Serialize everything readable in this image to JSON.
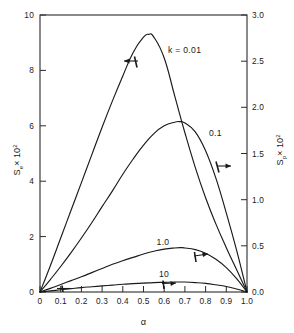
{
  "chart_data": {
    "type": "line",
    "title": "",
    "xlabel": "α",
    "ylabel_left": "Sₑ × 10²",
    "ylabel_right": "Sₚ × 10²",
    "xlim": [
      0,
      1.0
    ],
    "ylim_left": [
      0,
      10
    ],
    "ylim_right": [
      0.0,
      3.0
    ],
    "grid": false,
    "legend": "inline-curve-labels",
    "xticks": [
      "0",
      "0.1",
      "0.2",
      "0.3",
      "0.4",
      "0.5",
      "0.6",
      "0.7",
      "0.8",
      "0.9",
      "1.0"
    ],
    "xtick_values": [
      0,
      0.1,
      0.2,
      0.3,
      0.4,
      0.5,
      0.6,
      0.7,
      0.8,
      0.9,
      1.0
    ],
    "yticks_left": [
      "0",
      "2",
      "4",
      "6",
      "8",
      "10"
    ],
    "ytick_values_left": [
      0,
      2,
      4,
      6,
      8,
      10
    ],
    "yticks_right": [
      "0.0",
      "0.5",
      "1.0",
      "1.5",
      "2.0",
      "2.5",
      "3.0"
    ],
    "ytick_values_right": [
      0.0,
      0.5,
      1.0,
      1.5,
      2.0,
      2.5,
      3.0
    ],
    "series": [
      {
        "name": "k = 0.01",
        "label": "k = 0.01",
        "axis": "left",
        "arrow_direction": "left",
        "arrow_at": {
          "x": 0.455,
          "y": 8.35
        },
        "peak": {
          "x": 0.525,
          "y": 9.3
        },
        "x": [
          0.0,
          0.05,
          0.1,
          0.15,
          0.2,
          0.25,
          0.3,
          0.35,
          0.4,
          0.45,
          0.5,
          0.525,
          0.55,
          0.6,
          0.65,
          0.7,
          0.75,
          0.8,
          0.85,
          0.9,
          0.95,
          1.0
        ],
        "values": [
          0.0,
          0.95,
          1.95,
          2.95,
          3.95,
          4.95,
          5.95,
          6.9,
          7.8,
          8.65,
          9.2,
          9.3,
          9.2,
          8.45,
          7.1,
          5.75,
          4.5,
          3.4,
          2.45,
          1.6,
          0.8,
          0.0
        ]
      },
      {
        "name": "0.1",
        "label": "0.1",
        "axis": "left",
        "arrow_direction": "right",
        "arrow_at": {
          "x": 0.825,
          "y": 4.55
        },
        "peak": {
          "x": 0.675,
          "y": 6.15
        },
        "x": [
          0.0,
          0.05,
          0.1,
          0.15,
          0.2,
          0.25,
          0.3,
          0.35,
          0.4,
          0.45,
          0.5,
          0.55,
          0.6,
          0.65,
          0.675,
          0.7,
          0.75,
          0.8,
          0.85,
          0.9,
          0.95,
          1.0
        ],
        "values": [
          0.0,
          0.45,
          0.92,
          1.42,
          1.95,
          2.5,
          3.08,
          3.65,
          4.25,
          4.8,
          5.3,
          5.72,
          6.0,
          6.13,
          6.15,
          6.1,
          5.78,
          5.1,
          4.1,
          2.85,
          1.5,
          0.0
        ]
      },
      {
        "name": "1.0",
        "label": "1.0",
        "axis": "left",
        "arrow_direction": "right",
        "arrow_at": {
          "x": 0.775,
          "y": 1.45
        },
        "peak": {
          "x": 0.68,
          "y": 1.6
        },
        "x": [
          0.0,
          0.05,
          0.1,
          0.15,
          0.2,
          0.25,
          0.3,
          0.35,
          0.4,
          0.45,
          0.5,
          0.55,
          0.6,
          0.65,
          0.68,
          0.7,
          0.75,
          0.8,
          0.85,
          0.9,
          0.95,
          1.0
        ],
        "values": [
          0.0,
          0.13,
          0.27,
          0.41,
          0.55,
          0.7,
          0.85,
          1.0,
          1.13,
          1.25,
          1.37,
          1.47,
          1.55,
          1.59,
          1.6,
          1.59,
          1.53,
          1.4,
          1.18,
          0.88,
          0.48,
          0.0
        ]
      },
      {
        "name": "10",
        "label": "10",
        "axis": "left",
        "arrow_direction": "up",
        "arrow_at": {
          "x": 0.635,
          "y": 0.33
        },
        "peak": {
          "x": 0.68,
          "y": 0.36
        },
        "x": [
          0.0,
          0.05,
          0.1,
          0.15,
          0.2,
          0.25,
          0.3,
          0.35,
          0.4,
          0.45,
          0.5,
          0.55,
          0.6,
          0.65,
          0.68,
          0.7,
          0.75,
          0.8,
          0.85,
          0.9,
          0.95,
          1.0
        ],
        "values": [
          0.0,
          0.04,
          0.08,
          0.12,
          0.16,
          0.19,
          0.22,
          0.25,
          0.28,
          0.3,
          0.32,
          0.34,
          0.35,
          0.36,
          0.36,
          0.36,
          0.34,
          0.31,
          0.26,
          0.2,
          0.11,
          0.0
        ]
      },
      {
        "name": "low-alpha-tick",
        "label": "",
        "axis": "left",
        "arrow_direction": "up",
        "arrow_at": {
          "x": 0.105,
          "y": 0.1
        },
        "x": [],
        "values": []
      }
    ],
    "colors": {
      "axis": "#2b2b2b",
      "curve": "#1a1a1a",
      "background": "#ffffff"
    }
  },
  "labels": {
    "x_axis_title": "α",
    "y_left_main": "S",
    "y_left_sub": "e",
    "y_left_mult": "× 10",
    "y_left_exp": "2",
    "y_right_main": "S",
    "y_right_sub": "p",
    "y_right_mult": "× 10",
    "y_right_exp": "2",
    "curve_k001": "k = 0.01",
    "curve_01": "0.1",
    "curve_10": "1.0",
    "curve_100": "10"
  }
}
